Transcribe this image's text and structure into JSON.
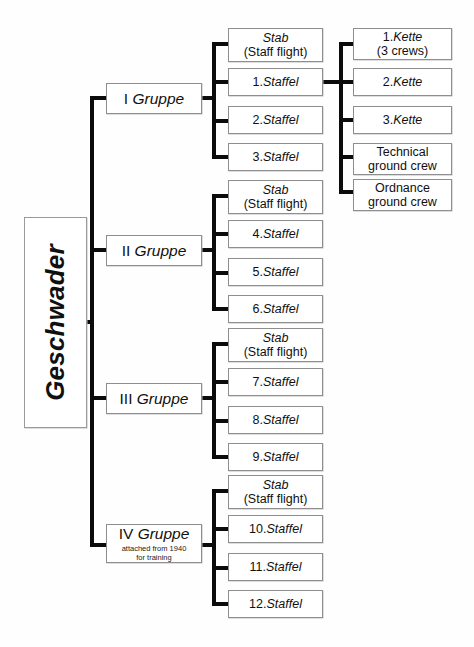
{
  "diagram": {
    "root": {
      "label": "Geschwader"
    },
    "groups": [
      {
        "id": "i",
        "roman": "I",
        "word": "Gruppe",
        "note_line1": "",
        "note_line2": "",
        "units": [
          {
            "line1": "Stab",
            "line2": "(Staff flight)"
          },
          {
            "num": "1.",
            "name": "Staffel"
          },
          {
            "num": "2.",
            "name": "Staffel"
          },
          {
            "num": "3.",
            "name": "Staffel"
          }
        ]
      },
      {
        "id": "ii",
        "roman": "II",
        "word": "Gruppe",
        "note_line1": "",
        "note_line2": "",
        "units": [
          {
            "line1": "Stab",
            "line2": "(Staff flight)"
          },
          {
            "num": "4.",
            "name": "Staffel"
          },
          {
            "num": "5.",
            "name": "Staffel"
          },
          {
            "num": "6.",
            "name": "Staffel"
          }
        ]
      },
      {
        "id": "iii",
        "roman": "III",
        "word": "Gruppe",
        "note_line1": "",
        "note_line2": "",
        "units": [
          {
            "line1": "Stab",
            "line2": "(Staff flight)"
          },
          {
            "num": "7.",
            "name": "Staffel"
          },
          {
            "num": "8.",
            "name": "Staffel"
          },
          {
            "num": "9.",
            "name": "Staffel"
          }
        ]
      },
      {
        "id": "iv",
        "roman": "IV",
        "word": "Gruppe",
        "note_line1": "attached from 1940",
        "note_line2": "for training",
        "units": [
          {
            "line1": "Stab",
            "line2": "(Staff flight)"
          },
          {
            "num": "10.",
            "name": "Staffel"
          },
          {
            "num": "11.",
            "name": "Staffel"
          },
          {
            "num": "12.",
            "name": "Staffel"
          }
        ]
      }
    ],
    "staffel_detail": {
      "parent": "1.Staffel",
      "items": [
        {
          "num": "1.",
          "name": "Kette",
          "sub": "(3 crews)"
        },
        {
          "num": "2.",
          "name": "Kette",
          "sub": ""
        },
        {
          "num": "3.",
          "name": "Kette",
          "sub": ""
        },
        {
          "plain_line1": "Technical",
          "plain_line2": "ground crew"
        },
        {
          "plain_line1": "Ordnance",
          "plain_line2": "ground crew"
        }
      ]
    },
    "colors": {
      "line": "#0b0b0b",
      "box_border": "#8e8e8e",
      "text": "#101010",
      "background": "#fefefe"
    }
  }
}
